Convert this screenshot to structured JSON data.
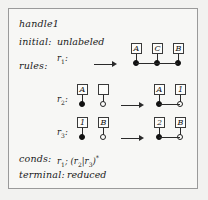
{
  "figure": {
    "title": "handle1",
    "rows": [
      {
        "label": "initial:",
        "value": "unlabeled"
      },
      {
        "label": "rules:",
        "value": ""
      },
      {
        "label": "conds:",
        "value": "r1; (r2|r3)*"
      },
      {
        "label": "terminal:",
        "value": "reduced"
      }
    ],
    "conds": {
      "first": "r",
      "first_sub": "1",
      "sep": "; (",
      "alt1": "r",
      "alt1_sub": "2",
      "bar": "|",
      "alt2": "r",
      "alt2_sub": "3",
      "close": ")",
      "star": "*"
    },
    "rules": [
      {
        "name": "r",
        "subscript": "1",
        "lhs": [],
        "rhs": [
          {
            "box_label": "A",
            "marker": "filled"
          },
          {
            "box_label": "C",
            "marker": "filled"
          },
          {
            "box_label": "B",
            "marker": "filled"
          }
        ],
        "rhs_connected": true,
        "lhs_connected": false
      },
      {
        "name": "r",
        "subscript": "2",
        "lhs": [
          {
            "box_label": "A",
            "marker": "filled"
          },
          {
            "box_label": "",
            "marker": "open"
          }
        ],
        "rhs": [
          {
            "box_label": "A",
            "marker": "filled"
          },
          {
            "box_label": "1",
            "marker": "open"
          }
        ],
        "rhs_connected": true,
        "lhs_connected": false
      },
      {
        "name": "r",
        "subscript": "3",
        "lhs": [
          {
            "box_label": "1",
            "marker": "filled"
          },
          {
            "box_label": "B",
            "marker": "open"
          }
        ],
        "rhs": [
          {
            "box_label": "2",
            "marker": "filled"
          },
          {
            "box_label": "B",
            "marker": "open"
          }
        ],
        "rhs_connected": true,
        "lhs_connected": false
      }
    ],
    "colors": {
      "background": "#f7f7f5",
      "border": "#9a9a9a",
      "ink": "#1a1a1a",
      "node_fill": "#fdfdfb",
      "dot_filled": "#111111"
    }
  }
}
